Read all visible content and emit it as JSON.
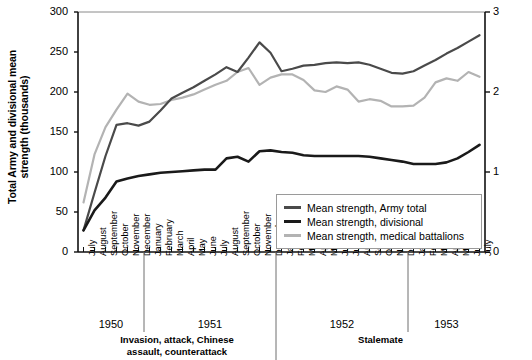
{
  "chart_data": {
    "type": "line",
    "title": "",
    "ylabel": "Total Army and divisional mean strength (thousands)",
    "ylabel_right": "Medical battalion mean strength (thousands)",
    "xlabel": "",
    "ylim": [
      0,
      300
    ],
    "yticks": [
      "0",
      "50",
      "100",
      "150",
      "200",
      "250",
      "300"
    ],
    "ylim_right": [
      0,
      3
    ],
    "yticks_right": [
      "0",
      "1",
      "2",
      "3"
    ],
    "grid": false,
    "legend_position": "bottom-right",
    "categories": [
      "July",
      "August",
      "September",
      "October",
      "November",
      "December",
      "January",
      "February",
      "March",
      "April",
      "May",
      "June",
      "July",
      "August",
      "September",
      "October",
      "November",
      "December",
      "January",
      "February",
      "March",
      "April",
      "May",
      "June",
      "July",
      "August",
      "September",
      "October",
      "November",
      "December",
      "January",
      "February",
      "March",
      "April",
      "May",
      "June",
      "July"
    ],
    "year_groups": [
      {
        "label": "1950",
        "start": 0,
        "end": 5
      },
      {
        "label": "1951",
        "start": 6,
        "end": 17
      },
      {
        "label": "1952",
        "start": 18,
        "end": 29
      },
      {
        "label": "1953",
        "start": 30,
        "end": 36
      }
    ],
    "phase_annotations": [
      {
        "label": "Invasion, attack, Chinese\nassault, counterattack",
        "start": 0,
        "end": 17
      },
      {
        "label": "Stalemate",
        "start": 18,
        "end": 36
      }
    ],
    "series": [
      {
        "name": "Mean strength, Army total",
        "color": "#4a4a4a",
        "axis": "left",
        "values": [
          27,
          74,
          120,
          159,
          161,
          158,
          163,
          177,
          192,
          199,
          206,
          214,
          222,
          231,
          225,
          243,
          262,
          249,
          226,
          229,
          233,
          234,
          236,
          237,
          236,
          237,
          234,
          229,
          224,
          223,
          226,
          233,
          240,
          248,
          255,
          263,
          271
        ]
      },
      {
        "name": "Mean strength, divisional",
        "color": "#1a1a1a",
        "axis": "left",
        "values": [
          27,
          52,
          68,
          88,
          92,
          95,
          97,
          99,
          100,
          101,
          102,
          103,
          103,
          117,
          119,
          113,
          126,
          127,
          125,
          124,
          121,
          120,
          120,
          120,
          120,
          120,
          119,
          117,
          115,
          113,
          110,
          110,
          110,
          112,
          117,
          125,
          134
        ]
      },
      {
        "name": "Mean strength, medical battalions",
        "color": "#b3b3b3",
        "axis": "right",
        "values": [
          0.62,
          1.22,
          1.56,
          1.78,
          1.98,
          1.88,
          1.84,
          1.85,
          1.9,
          1.93,
          1.97,
          2.03,
          2.09,
          2.14,
          2.25,
          2.3,
          2.09,
          2.18,
          2.22,
          2.22,
          2.15,
          2.02,
          2.0,
          2.07,
          2.03,
          1.88,
          1.91,
          1.89,
          1.82,
          1.82,
          1.83,
          1.93,
          2.12,
          2.17,
          2.14,
          2.25,
          2.19
        ]
      }
    ]
  }
}
